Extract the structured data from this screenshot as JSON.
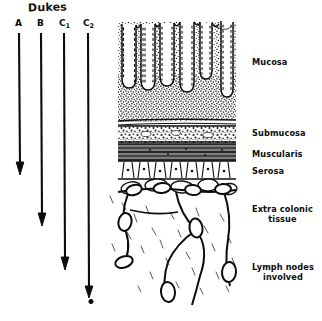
{
  "figure": {
    "title": "Dukes",
    "kind": "histology-cross-section-diagram",
    "background_color": "#ffffff",
    "ink_color": "#101010"
  },
  "stages": [
    {
      "id": "A",
      "label": "A",
      "sub": "",
      "x": 19,
      "label_y": 24,
      "arrow_top": 33,
      "arrow_bottom": 175,
      "depth": "mucosa"
    },
    {
      "id": "B",
      "label": "B",
      "sub": "",
      "x": 41,
      "label_y": 24,
      "arrow_top": 33,
      "arrow_bottom": 226,
      "depth": "muscularis / serosa"
    },
    {
      "id": "C1",
      "label": "C",
      "sub": "1",
      "x": 64,
      "label_y": 24,
      "arrow_top": 33,
      "arrow_bottom": 270,
      "depth": "extra colonic tissue"
    },
    {
      "id": "C2",
      "label": "C",
      "sub": "2",
      "x": 88,
      "label_y": 24,
      "arrow_top": 33,
      "arrow_bottom": 300,
      "depth": "lymph nodes involved"
    }
  ],
  "layers": [
    {
      "name": "Mucosa",
      "label": "Mucosa",
      "y": 58,
      "lines": [
        "Mucosa"
      ]
    },
    {
      "name": "Submucosa",
      "label": "Submucosa",
      "y": 129,
      "lines": [
        "Submucosa"
      ]
    },
    {
      "name": "Muscularis",
      "label": "Muscularis",
      "y": 150,
      "lines": [
        "Muscularis"
      ]
    },
    {
      "name": "Serosa",
      "label": "Serosa",
      "y": 167,
      "lines": [
        "Serosa"
      ]
    },
    {
      "name": "Extra colonic tissue",
      "label": "Extra colonic\ntissue",
      "y": 208,
      "lines": [
        "Extra colonic",
        "tissue"
      ]
    },
    {
      "name": "Lymph nodes involved",
      "label": "Lymph nodes\ninvolved",
      "y": 266,
      "lines": [
        "Lymph nodes",
        "involved"
      ]
    }
  ]
}
